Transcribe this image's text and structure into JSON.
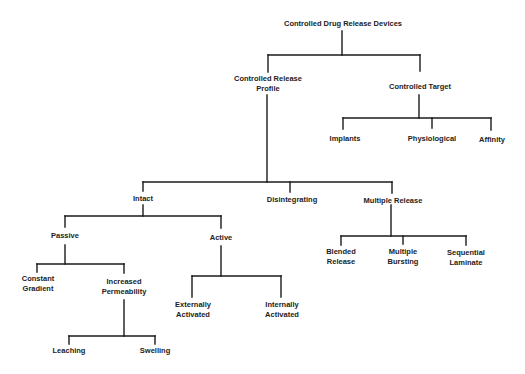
{
  "diagram": {
    "type": "tree",
    "line_color": "#1a1a1a",
    "text_color": "#222222",
    "root": {
      "label": "Controlled Drug Release Devices",
      "children": [
        {
          "label": [
            "Controlled Release",
            "Profile"
          ],
          "children": [
            {
              "label": "Intact",
              "children": [
                {
                  "label": "Passive",
                  "children": [
                    {
                      "label": [
                        "Constant",
                        "Gradient"
                      ]
                    },
                    {
                      "label": [
                        "Increased",
                        "Permeability"
                      ],
                      "children": [
                        {
                          "label": "Leaching"
                        },
                        {
                          "label": "Swelling"
                        }
                      ]
                    }
                  ]
                },
                {
                  "label": "Active",
                  "children": [
                    {
                      "label": [
                        "Externally",
                        "Activated"
                      ]
                    },
                    {
                      "label": [
                        "Internally",
                        "Activated"
                      ]
                    }
                  ]
                }
              ]
            },
            {
              "label": "Disintegrating"
            },
            {
              "label": "Multiple Release",
              "children": [
                {
                  "label": [
                    "Blended",
                    "Release"
                  ]
                },
                {
                  "label": [
                    "Multiple",
                    "Bursting"
                  ]
                },
                {
                  "label": [
                    "Sequential",
                    "Laminate"
                  ]
                }
              ]
            }
          ]
        },
        {
          "label": "Controlled Target",
          "children": [
            {
              "label": "Implants"
            },
            {
              "label": "Physiological"
            },
            {
              "label": "Affinity"
            }
          ]
        }
      ]
    }
  },
  "labels": {
    "root": "Controlled Drug Release Devices",
    "crp_1": "Controlled Release",
    "crp_2": "Profile",
    "target": "Controlled Target",
    "implants": "Implants",
    "physiological": "Physiological",
    "affinity": "Affinity",
    "intact": "Intact",
    "disintegrating": "Disintegrating",
    "multiple_release": "Multiple Release",
    "passive": "Passive",
    "active": "Active",
    "constant_1": "Constant",
    "constant_2": "Gradient",
    "increased_1": "Increased",
    "increased_2": "Permeability",
    "leaching": "Leaching",
    "swelling": "Swelling",
    "ext_1": "Externally",
    "ext_2": "Activated",
    "int_1": "Internally",
    "int_2": "Activated",
    "blended_1": "Blended",
    "blended_2": "Release",
    "bursting_1": "Multiple",
    "bursting_2": "Bursting",
    "sequential_1": "Sequential",
    "sequential_2": "Laminate"
  }
}
